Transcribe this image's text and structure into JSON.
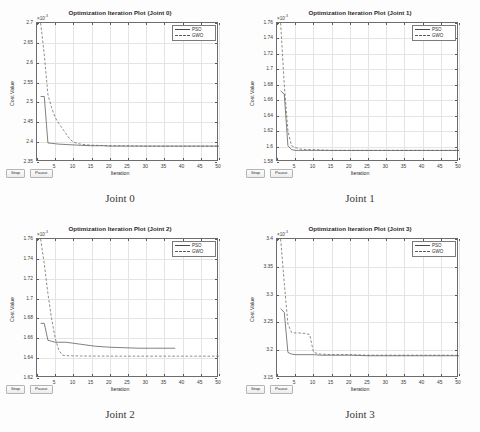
{
  "page": {
    "background": "#fdfdfd",
    "layout": "2x2 grid of MATLAB optimization iteration figures"
  },
  "common": {
    "legend": [
      {
        "label": "PSO",
        "style": "solid",
        "color": "#4a4a4a"
      },
      {
        "label": "GWO",
        "style": "dashed",
        "color": "#5a5a5a"
      }
    ],
    "buttons": [
      {
        "label": "Stop",
        "name": "stop-button"
      },
      {
        "label": "Pause",
        "name": "pause-button"
      }
    ],
    "xlabel": "Iteration",
    "ylabel": "Cost Value",
    "exponent_prefix": "×10",
    "exponent_power": "-3",
    "xticks": [
      0,
      5,
      10,
      15,
      20,
      25,
      30,
      35,
      40,
      45,
      50
    ],
    "xticklabels": [
      "",
      "5",
      "10",
      "15",
      "20",
      "25",
      "30",
      "35",
      "40",
      "45",
      "50"
    ],
    "xlim": [
      0,
      50
    ]
  },
  "panels": [
    {
      "id": "joint-0",
      "title": "Optimization Iteration Plot (Joint 0)",
      "caption": "Joint 0",
      "yticks": [
        2.35,
        2.4,
        2.45,
        2.5,
        2.55,
        2.6,
        2.65,
        2.7
      ],
      "yticklabels": [
        "2.35",
        "2.4",
        "2.45",
        "2.5",
        "2.55",
        "2.6",
        "2.65",
        "2.7"
      ],
      "ylim": [
        2.35,
        2.7
      ]
    },
    {
      "id": "joint-1",
      "title": "Optimization Iteration Plot (Joint 1)",
      "caption": "Joint 1",
      "yticks": [
        1.58,
        1.6,
        1.62,
        1.64,
        1.66,
        1.68,
        1.7,
        1.72,
        1.74,
        1.76
      ],
      "yticklabels": [
        "1.58",
        "1.6",
        "1.62",
        "1.64",
        "1.66",
        "1.68",
        "1.7",
        "1.72",
        "1.74",
        "1.76"
      ],
      "ylim": [
        1.58,
        1.76
      ]
    },
    {
      "id": "joint-2",
      "title": "Optimization Iteration Plot (Joint 2)",
      "caption": "Joint 2",
      "yticks": [
        1.62,
        1.64,
        1.66,
        1.68,
        1.7,
        1.72,
        1.74,
        1.76
      ],
      "yticklabels": [
        "1.62",
        "1.64",
        "1.66",
        "1.68",
        "1.7",
        "1.72",
        "1.74",
        "1.76"
      ],
      "ylim": [
        1.62,
        1.76
      ]
    },
    {
      "id": "joint-3",
      "title": "Optimization Iteration Plot (Joint 3)",
      "caption": "Joint 3",
      "yticks": [
        3.15,
        3.2,
        3.25,
        3.3,
        3.35,
        3.4
      ],
      "yticklabels": [
        "3.15",
        "3.2",
        "3.25",
        "3.3",
        "3.35",
        "3.4"
      ],
      "ylim": [
        3.15,
        3.4
      ]
    }
  ],
  "chart_data": [
    {
      "type": "line",
      "title": "Optimization Iteration Plot (Joint 0)",
      "subtitle": "Joint 0",
      "xlabel": "Iteration",
      "ylabel": "Cost Value",
      "y_exponent": -3,
      "xlim": [
        0,
        50
      ],
      "ylim": [
        2.35,
        2.7
      ],
      "grid": true,
      "legend_position": "top-right",
      "series": [
        {
          "name": "PSO",
          "style": "solid",
          "x": [
            1,
            2,
            3,
            4,
            5,
            6,
            8,
            10,
            12,
            15,
            18,
            20,
            25,
            30,
            35,
            40,
            45,
            50
          ],
          "values": [
            2.515,
            2.515,
            2.398,
            2.397,
            2.396,
            2.395,
            2.394,
            2.393,
            2.392,
            2.391,
            2.391,
            2.39,
            2.39,
            2.39,
            2.39,
            2.39,
            2.39,
            2.39
          ]
        },
        {
          "name": "GWO",
          "style": "dashed",
          "x": [
            1,
            2,
            3,
            4,
            5,
            6,
            7,
            8,
            9,
            10,
            11,
            12,
            14,
            16,
            20,
            25,
            30,
            35,
            40,
            45,
            50
          ],
          "values": [
            2.7,
            2.62,
            2.52,
            2.487,
            2.462,
            2.447,
            2.434,
            2.421,
            2.408,
            2.4,
            2.397,
            2.395,
            2.393,
            2.392,
            2.391,
            2.391,
            2.39,
            2.39,
            2.39,
            2.39,
            2.39
          ]
        }
      ]
    },
    {
      "type": "line",
      "title": "Optimization Iteration Plot (Joint 1)",
      "subtitle": "Joint 1",
      "xlabel": "Iteration",
      "ylabel": "Cost Value",
      "y_exponent": -3,
      "xlim": [
        0,
        50
      ],
      "ylim": [
        1.58,
        1.76
      ],
      "grid": true,
      "legend_position": "top-right",
      "series": [
        {
          "name": "PSO",
          "style": "solid",
          "x": [
            1,
            2,
            3,
            4,
            5,
            6,
            8,
            10,
            15,
            20,
            25,
            30,
            35,
            40,
            45,
            50
          ],
          "values": [
            1.672,
            1.668,
            1.601,
            1.596,
            1.595,
            1.595,
            1.595,
            1.595,
            1.595,
            1.595,
            1.595,
            1.595,
            1.595,
            1.595,
            1.595,
            1.595
          ]
        },
        {
          "name": "GWO",
          "style": "dashed",
          "x": [
            1,
            2,
            3,
            4,
            5,
            6,
            8,
            10,
            15,
            20,
            25,
            30,
            35,
            40,
            45,
            50
          ],
          "values": [
            1.76,
            1.68,
            1.62,
            1.601,
            1.599,
            1.597,
            1.596,
            1.596,
            1.595,
            1.595,
            1.595,
            1.595,
            1.595,
            1.595,
            1.595,
            1.595
          ]
        }
      ]
    },
    {
      "type": "line",
      "title": "Optimization Iteration Plot (Joint 2)",
      "subtitle": "Joint 2",
      "xlabel": "Iteration",
      "ylabel": "Cost Value",
      "y_exponent": -3,
      "xlim": [
        0,
        50
      ],
      "ylim": [
        1.62,
        1.76
      ],
      "grid": true,
      "legend_position": "top-right",
      "series": [
        {
          "name": "PSO",
          "style": "solid",
          "x": [
            1,
            2,
            3,
            4,
            5,
            6,
            8,
            10,
            12,
            14,
            16,
            18,
            20,
            24,
            28,
            32,
            36,
            38
          ],
          "values": [
            1.675,
            1.675,
            1.658,
            1.657,
            1.656,
            1.656,
            1.656,
            1.655,
            1.654,
            1.653,
            1.652,
            1.6515,
            1.651,
            1.6505,
            1.65,
            1.65,
            1.65,
            1.65
          ]
        },
        {
          "name": "GWO",
          "style": "dashed",
          "x": [
            1,
            2,
            3,
            4,
            5,
            6,
            7,
            8,
            10,
            12,
            15,
            20,
            25,
            30,
            35,
            40,
            45,
            50
          ],
          "values": [
            1.76,
            1.735,
            1.705,
            1.68,
            1.66,
            1.648,
            1.643,
            1.6425,
            1.6423,
            1.6422,
            1.6421,
            1.642,
            1.642,
            1.642,
            1.642,
            1.642,
            1.642,
            1.642
          ]
        }
      ]
    },
    {
      "type": "line",
      "title": "Optimization Iteration Plot (Joint 3)",
      "subtitle": "Joint 3",
      "xlabel": "Iteration",
      "ylabel": "Cost Value",
      "y_exponent": -3,
      "xlim": [
        0,
        50
      ],
      "ylim": [
        3.15,
        3.4
      ],
      "grid": true,
      "legend_position": "top-right",
      "series": [
        {
          "name": "PSO",
          "style": "solid",
          "x": [
            1,
            2,
            3,
            4,
            5,
            8,
            10,
            12,
            15,
            20,
            25,
            30,
            35,
            40,
            45,
            50
          ],
          "values": [
            3.275,
            3.268,
            3.196,
            3.193,
            3.192,
            3.192,
            3.192,
            3.191,
            3.191,
            3.191,
            3.19,
            3.19,
            3.19,
            3.19,
            3.19,
            3.19
          ]
        },
        {
          "name": "GWO",
          "style": "dashed",
          "x": [
            1,
            2,
            3,
            4,
            5,
            6,
            8,
            9,
            10,
            11,
            12,
            15,
            20,
            25,
            30,
            35,
            40,
            45,
            50
          ],
          "values": [
            3.4,
            3.32,
            3.247,
            3.232,
            3.231,
            3.231,
            3.23,
            3.228,
            3.197,
            3.194,
            3.193,
            3.192,
            3.192,
            3.191,
            3.191,
            3.191,
            3.191,
            3.191,
            3.191
          ]
        }
      ]
    }
  ]
}
